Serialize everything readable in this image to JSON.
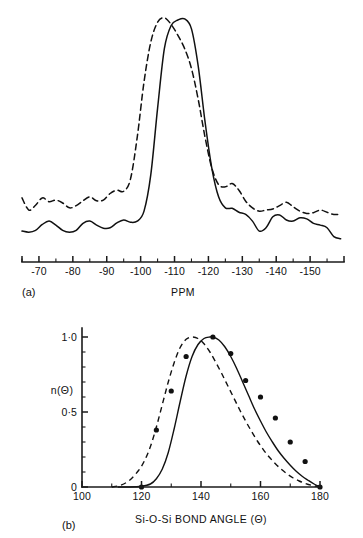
{
  "figure": {
    "panel_a_label": "(a)",
    "panel_b_label": "(b)"
  },
  "chart_data": [
    {
      "type": "line",
      "panel": "(a)",
      "title": "",
      "xlabel": "PPM",
      "ylabel": "",
      "xlim": [
        -65,
        -160
      ],
      "x_major_ticks": [
        -70,
        -80,
        -90,
        -100,
        -110,
        -120,
        -130,
        -140,
        -150
      ],
      "x_major_tick_labels": [
        "-70",
        "-80",
        "-90",
        "-100",
        "-110",
        "-120",
        "-130",
        "-140",
        "-150"
      ],
      "x_minor_ticks": [
        -65,
        -75,
        -85,
        -95,
        -105,
        -115,
        -125,
        -135,
        -145,
        -155
      ],
      "grid": false,
      "legend": null,
      "series": [
        {
          "name": "solid-trace",
          "style": "solid",
          "peak_ppm": -113,
          "peak_value": 1.0,
          "x": [
            -65,
            -67,
            -69,
            -71,
            -73,
            -75,
            -77,
            -79,
            -81,
            -83,
            -85,
            -87,
            -89,
            -91,
            -93,
            -95,
            -97,
            -99,
            -101,
            -103,
            -105,
            -107,
            -109,
            -111,
            -113,
            -115,
            -117,
            -119,
            -121,
            -123,
            -125,
            -127,
            -129,
            -131,
            -133,
            -135,
            -137,
            -139,
            -141,
            -143,
            -145,
            -147,
            -149,
            -151,
            -153,
            -155,
            -157,
            -159
          ],
          "y": [
            0.045,
            0.04,
            0.048,
            0.075,
            0.09,
            0.072,
            0.048,
            0.04,
            0.048,
            0.08,
            0.09,
            0.072,
            0.058,
            0.06,
            0.082,
            0.095,
            0.085,
            0.09,
            0.135,
            0.3,
            0.6,
            0.87,
            0.975,
            1.0,
            1.005,
            0.96,
            0.79,
            0.54,
            0.33,
            0.2,
            0.15,
            0.148,
            0.13,
            0.12,
            0.09,
            0.045,
            0.06,
            0.11,
            0.118,
            0.095,
            0.09,
            0.105,
            0.1,
            0.08,
            0.072,
            0.06,
            0.02,
            0.01
          ]
        },
        {
          "name": "dashed-trace",
          "style": "dashed",
          "peak_ppm": -110,
          "peak_value": 1.0,
          "x": [
            -65,
            -67,
            -69,
            -71,
            -73,
            -75,
            -77,
            -79,
            -81,
            -83,
            -85,
            -87,
            -89,
            -91,
            -93,
            -95,
            -97,
            -99,
            -101,
            -103,
            -105,
            -107,
            -109,
            -111,
            -113,
            -115,
            -117,
            -119,
            -121,
            -123,
            -125,
            -127,
            -129,
            -131,
            -133,
            -135,
            -137,
            -139,
            -141,
            -143,
            -145,
            -147,
            -149,
            -151,
            -153,
            -155,
            -157,
            -159
          ],
          "y": [
            0.195,
            0.14,
            0.162,
            0.195,
            0.178,
            0.185,
            0.172,
            0.15,
            0.16,
            0.182,
            0.2,
            0.182,
            0.185,
            0.215,
            0.23,
            0.225,
            0.28,
            0.47,
            0.72,
            0.9,
            0.99,
            1.01,
            0.98,
            0.93,
            0.87,
            0.78,
            0.64,
            0.47,
            0.33,
            0.255,
            0.245,
            0.26,
            0.23,
            0.18,
            0.15,
            0.135,
            0.14,
            0.145,
            0.16,
            0.175,
            0.155,
            0.135,
            0.125,
            0.128,
            0.14,
            0.13,
            0.12,
            0.122
          ]
        }
      ]
    },
    {
      "type": "line",
      "panel": "(b)",
      "title": "",
      "xlabel": "Si-O-Si BOND ANGLE (Θ)",
      "ylabel": "n(Θ)",
      "xlim": [
        100,
        180
      ],
      "ylim": [
        0,
        1.08
      ],
      "x_major_ticks": [
        100,
        120,
        140,
        160,
        180
      ],
      "x_major_tick_labels": [
        "100",
        "120",
        "140",
        "160",
        "180"
      ],
      "x_minor_ticks": [
        110,
        130,
        150,
        170
      ],
      "y_major_ticks": [
        0,
        0.5,
        1.0
      ],
      "y_major_tick_labels": [
        "0",
        "0·5",
        "1·0"
      ],
      "y_minor_ticks": [
        0.1,
        0.2,
        0.3,
        0.4,
        0.6,
        0.7,
        0.8,
        0.9
      ],
      "grid": false,
      "legend": null,
      "series": [
        {
          "name": "solid-curve",
          "style": "solid",
          "peak_angle": 144,
          "x": [
            112,
            116,
            120,
            123,
            125,
            127,
            129,
            131,
            133,
            135,
            137,
            139,
            141,
            143,
            144,
            146,
            148,
            150,
            152,
            154,
            156,
            158,
            160,
            162,
            164,
            166,
            168,
            170,
            172,
            174,
            176,
            178,
            180
          ],
          "y": [
            0.0,
            0.0,
            0.005,
            0.02,
            0.055,
            0.12,
            0.23,
            0.39,
            0.57,
            0.74,
            0.87,
            0.95,
            0.99,
            1.0,
            1.0,
            0.98,
            0.935,
            0.87,
            0.79,
            0.7,
            0.61,
            0.52,
            0.44,
            0.365,
            0.3,
            0.24,
            0.19,
            0.145,
            0.105,
            0.072,
            0.045,
            0.02,
            0.0
          ]
        },
        {
          "name": "dashed-curve",
          "style": "dashed",
          "peak_angle": 137,
          "x": [
            110,
            113,
            116,
            119,
            121,
            123,
            125,
            127,
            129,
            131,
            133,
            135,
            137,
            139,
            141,
            143,
            145,
            147,
            149,
            151,
            153,
            155,
            157,
            159,
            161,
            163,
            165,
            167,
            169,
            171,
            173,
            175,
            177,
            180
          ],
          "y": [
            0.0,
            0.012,
            0.045,
            0.11,
            0.175,
            0.27,
            0.4,
            0.55,
            0.7,
            0.83,
            0.93,
            0.985,
            1.0,
            0.99,
            0.955,
            0.9,
            0.83,
            0.755,
            0.675,
            0.595,
            0.515,
            0.44,
            0.37,
            0.305,
            0.248,
            0.198,
            0.155,
            0.118,
            0.086,
            0.06,
            0.04,
            0.024,
            0.012,
            0.0
          ]
        },
        {
          "name": "data-points",
          "style": "scatter",
          "x": [
            120,
            125,
            130,
            135,
            144,
            150,
            155,
            160,
            165,
            170,
            175,
            180
          ],
          "y": [
            0.0,
            0.38,
            0.64,
            0.87,
            1.0,
            0.89,
            0.71,
            0.6,
            0.46,
            0.3,
            0.17,
            0.0
          ]
        }
      ]
    }
  ]
}
